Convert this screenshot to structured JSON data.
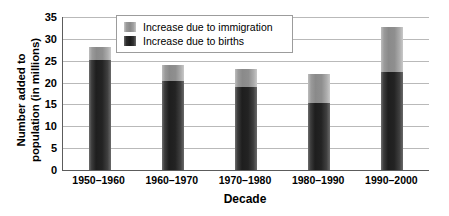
{
  "chart_data": {
    "type": "bar",
    "subtype": "stacked-bar",
    "title": "",
    "xlabel": "Decade",
    "ylabel": "Number added to population (in millions)",
    "ylabel_lines": [
      "Number added to",
      "population (in millions)"
    ],
    "categories": [
      "1950–1960",
      "1960–1970",
      "1970–1980",
      "1980–1990",
      "1990–2000"
    ],
    "series": [
      {
        "name": "Increase due to births",
        "values": [
          25.1,
          20.3,
          19.0,
          15.3,
          22.4
        ],
        "color": "#232323",
        "stack_order": 0
      },
      {
        "name": "Increase due to immigration",
        "values": [
          3.0,
          3.8,
          4.0,
          6.7,
          10.3
        ],
        "color": "#8f8f8f",
        "stack_order": 1
      }
    ],
    "totals": [
      28.1,
      24.1,
      23.0,
      22.0,
      32.7
    ],
    "ylim": [
      0,
      35
    ],
    "ytick_values": [
      0,
      5,
      10,
      15,
      20,
      25,
      30,
      35
    ],
    "ytick_labels": [
      "0",
      "5",
      "10",
      "15",
      "20",
      "25",
      "30",
      "35"
    ],
    "ystep": 5,
    "grid": {
      "horizontal": true,
      "vertical": false,
      "color": "#b9b9b9"
    },
    "legend": {
      "position": "inside-top-left",
      "entries": [
        {
          "label": "Increase due to immigration",
          "swatch": "immigration"
        },
        {
          "label": "Increase due to births",
          "swatch": "births"
        }
      ]
    },
    "axis_color": "#5c5c5c",
    "background": "#ffffff"
  }
}
